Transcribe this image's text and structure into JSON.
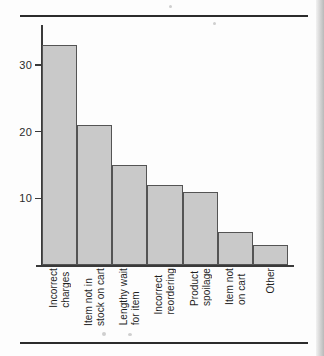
{
  "chart_data": {
    "type": "bar",
    "title": "",
    "subtitle": "",
    "xlabel": "",
    "ylabel": "",
    "categories": [
      "Incorrect\ncharges",
      "Item not in\nstock on cart",
      "Lengthy wait\nfor item",
      "Incorrect\nreordering",
      "Product\nspoilage",
      "Item not\non cart",
      "Other"
    ],
    "values": [
      33,
      21,
      15,
      12,
      11,
      5,
      3
    ],
    "ylim": [
      0,
      36
    ],
    "yticks": [
      10,
      20,
      30
    ],
    "ytick_labels": [
      "10",
      "20",
      "30"
    ],
    "grid": false,
    "legend": null,
    "bar_fill_color": "#c9c9c9",
    "bar_edge_color": "#545454",
    "axis_color": "#3a3a3a",
    "rule_color": "#2c2c2c",
    "orientation": "vertical",
    "tick_label_rotation": 90
  },
  "figure": {
    "top_rule": "",
    "bottom_rule": ""
  }
}
